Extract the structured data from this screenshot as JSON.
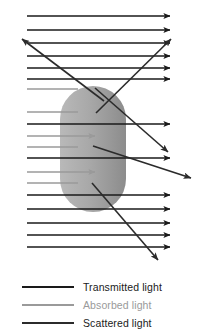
{
  "figure": {
    "particle": {
      "name": "particle",
      "fill_light": "#b4b4b4",
      "fill_dark": "#8f8f8f",
      "x": 60,
      "y": 86,
      "width": 66,
      "height": 126,
      "corner_radius": 33
    },
    "colors": {
      "transmitted": "#1a1a1a",
      "absorbed": "#9a9a9a",
      "scattered": "#2b2b2b",
      "background": "#ffffff",
      "text": "#1a1a1a"
    },
    "transmitted_rays": [
      {
        "y": 16,
        "x1": 27,
        "x2": 163
      },
      {
        "y": 30,
        "x1": 27,
        "x2": 163
      },
      {
        "y": 43,
        "x1": 27,
        "x2": 163
      },
      {
        "y": 56,
        "x1": 27,
        "x2": 163
      },
      {
        "y": 68,
        "x1": 27,
        "x2": 163
      },
      {
        "y": 79,
        "x1": 27,
        "x2": 163
      },
      {
        "y": 124,
        "x1": 27,
        "x2": 163
      },
      {
        "y": 158,
        "x1": 27,
        "x2": 163
      },
      {
        "y": 195,
        "x1": 27,
        "x2": 163
      },
      {
        "y": 209,
        "x1": 27,
        "x2": 163
      },
      {
        "y": 223,
        "x1": 27,
        "x2": 163
      },
      {
        "y": 235,
        "x1": 27,
        "x2": 163
      },
      {
        "y": 247,
        "x1": 27,
        "x2": 163
      }
    ],
    "absorbed_rays": [
      {
        "y": 136,
        "x1": 27,
        "x2": 92
      },
      {
        "y": 172,
        "x1": 27,
        "x2": 92
      }
    ],
    "absorbed_stub_rays": [
      {
        "y": 89,
        "x1": 27,
        "x2": 62
      },
      {
        "y": 112,
        "x1": 27,
        "x2": 62
      },
      {
        "y": 147,
        "x1": 27,
        "x2": 62
      },
      {
        "y": 183,
        "x1": 27,
        "x2": 62
      }
    ],
    "scattered_rays": [
      {
        "name": "scatter-up-left",
        "x1": 100,
        "y1": 100,
        "x2": 21,
        "y2": 39
      },
      {
        "name": "scatter-up-right",
        "x1": 97,
        "y1": 112,
        "x2": 172,
        "y2": 38
      },
      {
        "name": "scatter-down-right-upper",
        "x1": 95,
        "y1": 88,
        "x2": 170,
        "y2": 153
      },
      {
        "name": "scatter-down-right-lower",
        "x1": 93,
        "y1": 145,
        "x2": 193,
        "y2": 179
      },
      {
        "name": "scatter-down-right-far",
        "x1": 92,
        "y1": 182,
        "x2": 159,
        "y2": 261
      }
    ]
  },
  "legend": {
    "items": [
      {
        "label": "Transmitted light",
        "color": "#1a1a1a",
        "muted": false
      },
      {
        "label": "Absorbed light",
        "color": "#9a9a9a",
        "muted": true
      },
      {
        "label": "Scattered light",
        "color": "#2b2b2b",
        "muted": false
      }
    ]
  }
}
